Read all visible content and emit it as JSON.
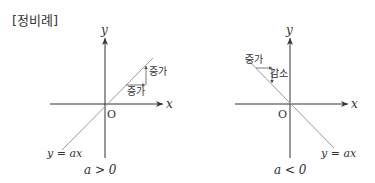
{
  "title": "[정비례]",
  "graph_left": {
    "y_axis_label": "y",
    "x_axis_label": "x",
    "origin_label": "O",
    "line_label": "y = ax",
    "condition": "a > 0",
    "annot_vertical": "증가",
    "annot_horizontal": "증가"
  },
  "graph_right": {
    "y_axis_label": "y",
    "x_axis_label": "x",
    "origin_label": "O",
    "line_label": "y = ax",
    "condition": "a < 0",
    "annot_horizontal": "증가",
    "annot_vertical": "감소"
  },
  "colors": {
    "axis": "#333333",
    "line": "#999999",
    "text": "#333333"
  }
}
